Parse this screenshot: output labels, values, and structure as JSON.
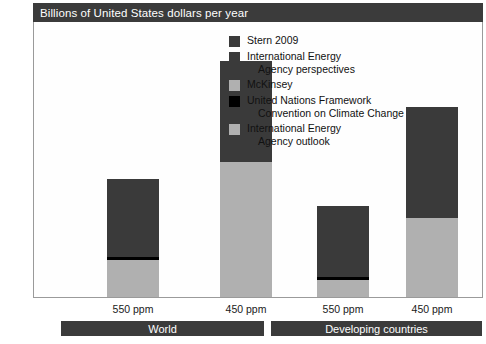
{
  "banner": {
    "title": "Billions of United States dollars per year"
  },
  "chart_data": {
    "type": "bar",
    "title": "Billions of United States dollars per year",
    "xlabel": "",
    "ylabel": "Billions of United States dollars per year",
    "ylim": [
      0,
      1400
    ],
    "yticks": [
      "0",
      "200",
      "400",
      "600",
      "800",
      "1 000",
      "1 200",
      "1 400"
    ],
    "ytick_values": [
      0,
      200,
      400,
      600,
      800,
      1000,
      1200,
      1400
    ],
    "grid": false,
    "stacked": true,
    "legend_position": "inside-top-right",
    "categories": [
      "550 ppm",
      "450 ppm",
      "550 ppm",
      "450 ppm"
    ],
    "groups": [
      {
        "label": "World",
        "categories": [
          "550 ppm",
          "450 ppm"
        ]
      },
      {
        "label": "Developing countries",
        "categories": [
          "550 ppm",
          "450 ppm"
        ]
      }
    ],
    "series": [
      {
        "name": "Stern 2009",
        "color": "#3a3a3a",
        "values": [
          0,
          515,
          0,
          565
        ]
      },
      {
        "name": "International Energy Agency perspectives",
        "color": "#3a3a3a",
        "values": [
          395,
          0,
          363,
          0
        ]
      },
      {
        "name": "McKinsey",
        "color": "#b0b0b0",
        "values": [
          0,
          685,
          0,
          400
        ]
      },
      {
        "name": "United Nations Framework Convention on Climate Change",
        "color": "#000000",
        "values": [
          15,
          0,
          15,
          0
        ]
      },
      {
        "name": "International Energy Agency outlook",
        "color": "#b0b0b0",
        "values": [
          190,
          0,
          85,
          0
        ]
      }
    ],
    "bar_totals": [
      600,
      1200,
      463,
      965
    ]
  },
  "legend": {
    "items": [
      {
        "label": "Stern 2009",
        "continuation": "",
        "color": "#3a3a3a"
      },
      {
        "label": "International Energy",
        "continuation": "Agency perspectives",
        "color": "#3a3a3a"
      },
      {
        "label": "McKinsey",
        "continuation": "",
        "color": "#b0b0b0"
      },
      {
        "label": "United Nations Framework",
        "continuation": "Convention on Climate Change",
        "color": "#000000"
      },
      {
        "label": "International Energy",
        "continuation": "Agency outlook",
        "color": "#b0b0b0"
      }
    ]
  },
  "axis": {
    "y_ticks": [
      "1 400",
      "1 200",
      "1 000",
      "800",
      "600",
      "400",
      "200",
      "0"
    ]
  },
  "x_axis": {
    "labels": [
      "550 ppm",
      "450 ppm",
      "550 ppm",
      "450 ppm"
    ]
  },
  "groups": {
    "items": [
      {
        "label": "World"
      },
      {
        "label": "Developing countries"
      }
    ]
  },
  "colors": {
    "dark": "#3a3a3a",
    "light": "#b0b0b0",
    "black": "#000000",
    "banner": "#3b3b3b",
    "frame": "#9a9a9a"
  }
}
